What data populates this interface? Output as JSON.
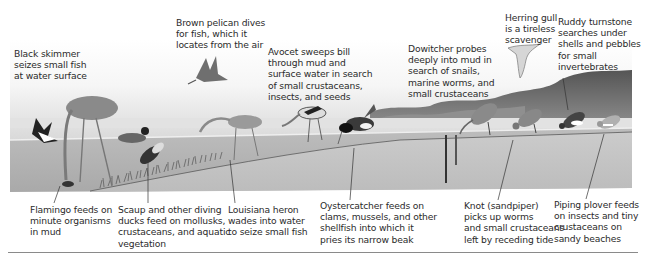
{
  "figure": {
    "colors": {
      "sky_top": "#ffffff",
      "sky_bottom": "#dedede",
      "water": "#b5b5b5",
      "mud": "#c4c4c4",
      "hills": "#6e6e6e",
      "text": "#2b2b2b",
      "leader": "#333333"
    },
    "top_labels": [
      {
        "id": "black-skimmer",
        "text": "Black skimmer\nseizes small fish\nat water surface",
        "x": 14,
        "y": 48
      },
      {
        "id": "brown-pelican",
        "text": "Brown pelican dives\nfor fish, which it\nlocates from the air",
        "x": 176,
        "y": 17
      },
      {
        "id": "avocet",
        "text": "Avocet sweeps bill\nthrough mud and\nsurface water in search\nof small crustaceans,\ninsects, and seeds",
        "x": 268,
        "y": 46
      },
      {
        "id": "dowitcher",
        "text": "Dowitcher probes\ndeeply into mud in\nsearch of snails,\nmarine worms, and\nsmall crustaceans",
        "x": 408,
        "y": 43
      },
      {
        "id": "herring-gull",
        "text": "Herring gull\nis a tireless\nscavenger",
        "x": 505,
        "y": 12
      },
      {
        "id": "ruddy-turnstone",
        "text": "Ruddy turnstone\nsearches under\nshells and pebbles\nfor small\ninvertebrates",
        "x": 558,
        "y": 16
      }
    ],
    "bottom_labels": [
      {
        "id": "flamingo",
        "text": "Flamingo feeds on\nminute organisms\nin mud",
        "x": 30,
        "y": 204
      },
      {
        "id": "scaup",
        "text": "Scaup and other diving\nducks feed on mollusks,\ncrustaceans, and aquatic\nvegetation",
        "x": 118,
        "y": 204
      },
      {
        "id": "louisiana-heron",
        "text": "Louisiana heron\nwades into water\nto seize small fish",
        "x": 228,
        "y": 204
      },
      {
        "id": "oystercatcher",
        "text": "Oystercatcher feeds on\nclams, mussels, and other\nshellfish into which it\npries its narrow beak",
        "x": 320,
        "y": 200
      },
      {
        "id": "knot",
        "text": "Knot (sandpiper)\npicks up worms\nand small crustaceans\nleft by receding tide",
        "x": 464,
        "y": 200
      },
      {
        "id": "piping-plover",
        "text": "Piping plover feeds\non insects and tiny\ncrustaceans on\nsandy beaches",
        "x": 554,
        "y": 199
      }
    ],
    "birds": [
      {
        "name": "black-skimmer"
      },
      {
        "name": "flamingo"
      },
      {
        "name": "brown-pelican"
      },
      {
        "name": "scaup-surface"
      },
      {
        "name": "scaup-diving"
      },
      {
        "name": "louisiana-heron"
      },
      {
        "name": "avocet"
      },
      {
        "name": "oystercatcher"
      },
      {
        "name": "dowitcher"
      },
      {
        "name": "knot"
      },
      {
        "name": "ruddy-turnstone"
      },
      {
        "name": "piping-plover"
      },
      {
        "name": "herring-gull"
      }
    ]
  }
}
